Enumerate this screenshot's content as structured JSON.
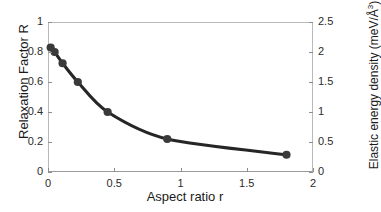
{
  "chart_data": {
    "type": "line",
    "title": "",
    "xlabel": "Aspect ratio r",
    "ylabel": "Relaxation Factor R",
    "ylabel_right_prefix": "Elastic energy density (meV/",
    "ylabel_right_unit": "Å",
    "ylabel_right_exponent": "3",
    "ylabel_right_suffix": ")",
    "ylabel_right_full": "Elastic energy density (meV/Å3)",
    "xlim": [
      0,
      2
    ],
    "ylim": [
      0,
      1
    ],
    "ylim_right": [
      0,
      2.5
    ],
    "grid": false,
    "legend": "none",
    "xticks": [
      "0",
      "0.5",
      "1",
      "1.5",
      "2"
    ],
    "xtick_values": [
      0,
      0.5,
      1,
      1.5,
      2
    ],
    "yticks_left": [
      "0",
      "0.2",
      "0.4",
      "0.6",
      "0.8",
      "1"
    ],
    "ytick_values_left": [
      0,
      0.2,
      0.4,
      0.6,
      0.8,
      1
    ],
    "yticks_right": [
      "0",
      "0.5",
      "1",
      "1.5",
      "2",
      "2.5"
    ],
    "ytick_values_right": [
      0,
      0.5,
      1,
      1.5,
      2,
      2.5
    ],
    "marker_color": "#3a3a3a",
    "line_color": "#262626",
    "series": [
      {
        "name": "Relaxation Factor R",
        "x": [
          0.02,
          0.05,
          0.11,
          0.225,
          0.45,
          0.9,
          1.8
        ],
        "values": [
          0.83,
          0.8,
          0.725,
          0.6,
          0.4,
          0.22,
          0.115
        ],
        "values_right_axis": [
          2.075,
          2.0,
          1.8125,
          1.5,
          1.0,
          0.55,
          0.2875
        ]
      }
    ]
  },
  "axes": {
    "x_title": "Aspect ratio r",
    "y_left_title": "Relaxation Factor R"
  }
}
